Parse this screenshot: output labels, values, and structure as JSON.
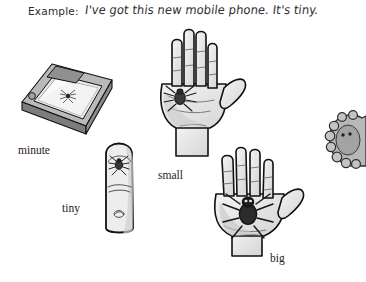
{
  "page": {
    "background_color": "#ffffff",
    "width": 364,
    "height": 282
  },
  "example": {
    "label": "Example:",
    "sentence": "I've got this new mobile phone. It's tiny."
  },
  "captions": {
    "minute": "minute",
    "small": "small",
    "tiny": "tiny",
    "big": "big"
  },
  "illustrations": [
    {
      "name": "microscope-slide-with-spider",
      "caption": "minute",
      "description": "A framed microscope slide shown in perspective with a barely visible spider inside"
    },
    {
      "name": "open-hand-with-small-spider",
      "caption": "small",
      "description": "An open palm with a small spider resting on it"
    },
    {
      "name": "fingertip-with-tiny-spider",
      "caption": "tiny",
      "description": "A single upright finger with a tiny spider on the fingertip"
    },
    {
      "name": "open-hand-with-big-spider",
      "caption": "big",
      "description": "An open palm with a large dark spider covering the palm"
    },
    {
      "name": "huge-furry-spider-cropped",
      "caption": "",
      "description": "A large furry spider cropped by the right edge of the page"
    }
  ],
  "colors": {
    "ink": "#1c1c1c",
    "text": "#2f2f2f",
    "line": "#111111",
    "skin_fill": "#efefef",
    "skin_shade": "#d2d2d2",
    "slide_gray": "#9a9a9a",
    "slide_dark": "#6f6f6f",
    "slide_light": "#e8e8e8",
    "spider_dark": "#2a2a2a",
    "spider_mid": "#555555",
    "fur_gray": "#b5b5b5"
  }
}
